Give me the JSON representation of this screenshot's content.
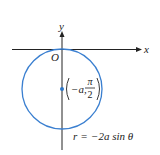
{
  "diagram": {
    "type": "polar-curve",
    "axes": {
      "x_label": "x",
      "y_label": "y",
      "origin_label": "O"
    },
    "curve": {
      "equation_lhs": "r",
      "equation_eq": "=",
      "equation_rhs": "−2a sin θ",
      "shape": "circle",
      "color": "#3a7fd0"
    },
    "center_point": {
      "label_coord_a": "−a,",
      "label_pi": "π",
      "label_two": "2",
      "color": "#2f78c8"
    },
    "colors": {
      "axis": "#222222",
      "circle": "#3a7fd0"
    }
  }
}
